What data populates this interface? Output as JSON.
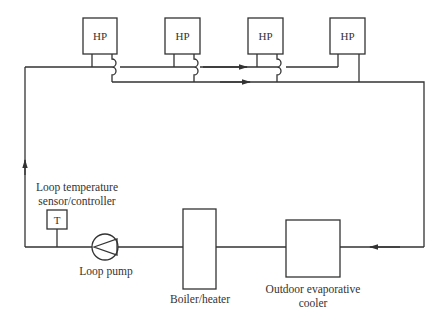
{
  "diagram": {
    "type": "water-loop heat pump system schematic",
    "heat_pumps": [
      {
        "label": "HP"
      },
      {
        "label": "HP"
      },
      {
        "label": "HP"
      },
      {
        "label": "HP"
      }
    ],
    "sensor": {
      "symbol": "T",
      "label_line1": "Loop temperature",
      "label_line2": "sensor/controller"
    },
    "pump": {
      "label": "Loop pump"
    },
    "boiler": {
      "label": "Boiler/heater"
    },
    "cooler": {
      "label_line1": "Outdoor evaporative",
      "label_line2": "cooler"
    },
    "colors": {
      "line": "#333333",
      "background": "#ffffff"
    }
  }
}
